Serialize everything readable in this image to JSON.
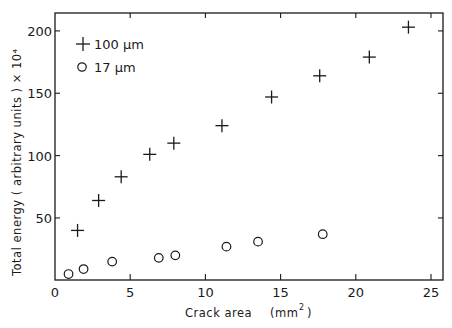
{
  "chart_data": {
    "type": "scatter",
    "title": "",
    "xlabel": "Crack   area   (mm²)",
    "ylabel": "Total  energy   ( arbitrary   units ) × 10⁴",
    "xlim": [
      0,
      25.8
    ],
    "ylim": [
      0,
      214
    ],
    "x_ticks": [
      0,
      5,
      10,
      15,
      20,
      25
    ],
    "y_ticks": [
      50,
      100,
      150,
      200
    ],
    "grid": false,
    "legend_position": "upper-left",
    "series": [
      {
        "name": "100 µm",
        "marker": "plus",
        "x": [
          1.5,
          2.9,
          4.4,
          6.3,
          7.9,
          11.1,
          14.4,
          17.6,
          20.9,
          23.5
        ],
        "y": [
          40,
          64,
          83,
          101,
          110,
          124,
          147,
          164,
          179,
          203
        ]
      },
      {
        "name": "17 µm",
        "marker": "circle",
        "x": [
          0.9,
          1.9,
          3.8,
          6.9,
          8.0,
          11.4,
          13.5,
          17.8
        ],
        "y": [
          5,
          9,
          15,
          18,
          20,
          27,
          31,
          37
        ]
      }
    ]
  },
  "legend": {
    "item0": "100 µm",
    "item1": "17 µm"
  },
  "axis": {
    "x_title_main": "Crack   area",
    "x_title_unit": "(mm",
    "x_title_sup": "2",
    "x_title_close": ")",
    "y_title": "Total  energy    ( arbitrary    units ) × 10⁴",
    "x_tick_labels": [
      "0",
      "5",
      "10",
      "15",
      "20",
      "25"
    ],
    "y_tick_labels": [
      "50",
      "100",
      "150",
      "200"
    ]
  }
}
